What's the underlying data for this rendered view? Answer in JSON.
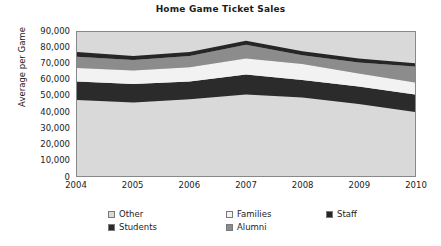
{
  "chart_data": {
    "type": "area",
    "title": "Home Game Ticket Sales",
    "xlabel": "",
    "ylabel": "Average per Game",
    "stacked": true,
    "grid": false,
    "legend_position": "bottom",
    "categories": [
      "2004",
      "2005",
      "2006",
      "2007",
      "2008",
      "2009",
      "2010"
    ],
    "x": [
      2004,
      2005,
      2006,
      2007,
      2008,
      2009,
      2010
    ],
    "xlim": [
      2004,
      2010
    ],
    "ylim": [
      0,
      90000
    ],
    "yticks": [
      0,
      10000,
      20000,
      30000,
      40000,
      50000,
      60000,
      70000,
      80000,
      90000
    ],
    "ytick_labels": [
      "0",
      "10,000",
      "20,000",
      "30,000",
      "40,000",
      "50,000",
      "60,000",
      "70,000",
      "80,000",
      "90,000"
    ],
    "stack_order_bottom_to_top": [
      "Other",
      "Students",
      "Families",
      "Alumni",
      "Staff"
    ],
    "series": [
      {
        "name": "Other",
        "color": "#d9d9d9",
        "values": [
          47500,
          46000,
          48000,
          51000,
          49000,
          45000,
          40000
        ],
        "cumulative_top": [
          47500,
          46000,
          48000,
          51000,
          49000,
          45000,
          40000
        ]
      },
      {
        "name": "Students",
        "color": "#2b2b2b",
        "values": [
          11500,
          11500,
          11000,
          12500,
          11000,
          11000,
          11000
        ],
        "cumulative_top": [
          59000,
          57500,
          59000,
          63500,
          60000,
          56000,
          51000
        ]
      },
      {
        "name": "Families",
        "color": "#f2f2f2",
        "values": [
          8500,
          8500,
          9000,
          10000,
          10000,
          8000,
          7500
        ],
        "cumulative_top": [
          67500,
          66000,
          68000,
          73500,
          70000,
          64000,
          58500
        ]
      },
      {
        "name": "Alumni",
        "color": "#8c8c8c",
        "values": [
          7000,
          6500,
          7000,
          8500,
          5500,
          7000,
          10000
        ],
        "cumulative_top": [
          74500,
          72500,
          75000,
          82000,
          75500,
          71000,
          68500
        ]
      },
      {
        "name": "Staff",
        "color": "#262626",
        "values": [
          3000,
          2500,
          2500,
          2500,
          2500,
          2500,
          2000
        ],
        "cumulative_top": [
          77500,
          75000,
          77500,
          84500,
          78000,
          73500,
          70500
        ]
      }
    ],
    "totals": [
      77500,
      75000,
      77500,
      84500,
      78000,
      73500,
      70500
    ]
  },
  "legend": {
    "entries": [
      {
        "label": "Other",
        "color": "#d9d9d9"
      },
      {
        "label": "Families",
        "color": "#f2f2f2"
      },
      {
        "label": "Staff",
        "color": "#262626"
      },
      {
        "label": "Students",
        "color": "#2b2b2b"
      },
      {
        "label": "Alumni",
        "color": "#8c8c8c"
      }
    ]
  },
  "colors": {
    "plot_background": "#d9d9d9",
    "plot_border": "#888888",
    "page_background": "#ffffff",
    "text": "#1c1c1c"
  }
}
